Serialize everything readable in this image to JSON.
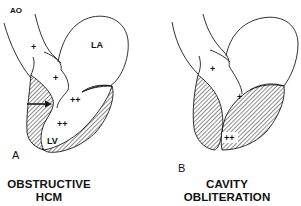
{
  "panels": [
    {
      "id": "A",
      "letter": "A",
      "caption_line1": "OBSTRUCTIVE",
      "caption_line2": "HCM",
      "labels": {
        "aorta": "AO",
        "left_atrium": "LA",
        "left_ventricle": "LV"
      },
      "pressure_marks": [
        "+",
        "+",
        "++",
        "++"
      ],
      "has_arrow": true
    },
    {
      "id": "B",
      "letter": "B",
      "caption_line1": "CAVITY",
      "caption_line2": "OBLITERATION",
      "labels": {},
      "pressure_marks": [
        "+",
        "+",
        "++"
      ],
      "has_arrow": false
    }
  ],
  "colors": {
    "line": "#1a1a1a",
    "background": "#ffffff",
    "hatch": "#1a1a1a"
  }
}
